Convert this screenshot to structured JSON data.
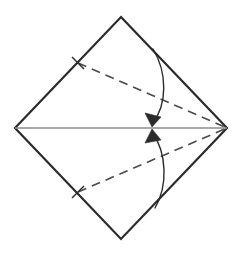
{
  "figure": {
    "kind": "origami-fold-diagram",
    "title": "Origami fold step: fold left corners to center along the horizontal axis",
    "canvas": {
      "width": 241,
      "height": 261,
      "background": "#ffffff"
    }
  },
  "colors": {
    "outline": "#2b2b2b",
    "crease_dashed": "#4a4a4a",
    "axis_line": "#8c8c8c",
    "arrow": "#2b2b2b",
    "background": "#ffffff"
  },
  "strokes": {
    "outline_width": 2.2,
    "dashed_width": 1.6,
    "dash_pattern": "9 6",
    "axis_width": 1.3,
    "arrow_width": 1.4
  },
  "shapes": {
    "square_sheet": {
      "name": "square-sheet",
      "label": "Paper square rotated 45 degrees",
      "vertices": {
        "top": {
          "x": 121,
          "y": 17
        },
        "right": {
          "x": 227,
          "y": 128
        },
        "bottom": {
          "x": 121,
          "y": 239
        },
        "left": {
          "x": 15,
          "y": 128
        }
      },
      "points": "121,17 227,128 121,239 15,128"
    },
    "center_axis": {
      "name": "horizontal-center-axis",
      "label": "Existing horizontal crease from left corner to right corner",
      "x1": 15,
      "y1": 128,
      "x2": 227,
      "y2": 128
    },
    "crease_upper": {
      "name": "upper-crease-line",
      "label": "Upper dashed valley fold from upper-left edge to right corner",
      "x1": 78,
      "y1": 63,
      "x2": 227,
      "y2": 128
    },
    "crease_lower": {
      "name": "lower-crease-line",
      "label": "Lower dashed valley fold from lower-left edge to right corner",
      "x1": 78,
      "y1": 192,
      "x2": 227,
      "y2": 128
    },
    "arrow_upper": {
      "name": "upper-fold-arrow",
      "label": "Curved arrow folding the top edge down to the center",
      "path": "M 153,49 C 167,72 168,104 152,124",
      "head": "152,127 145,113 161,117"
    },
    "arrow_lower": {
      "name": "lower-fold-arrow",
      "label": "Curved arrow folding the bottom edge up to the center",
      "path": "M 155,208 C 168,186 167,153 152,132",
      "head": "152,129 161,140 145,143"
    }
  },
  "tick_marks": {
    "name": "crease-end-ticks",
    "label": "Short tick marks where the dashed creases meet the folded edges",
    "items": [
      {
        "x1": 72,
        "y1": 57,
        "x2": 84,
        "y2": 69
      },
      {
        "x1": 72,
        "y1": 198,
        "x2": 84,
        "y2": 186
      }
    ]
  }
}
